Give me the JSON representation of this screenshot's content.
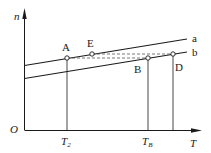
{
  "diagram": {
    "axes": {
      "y_label": "n",
      "x_label": "T",
      "origin_label": "O"
    },
    "lines": [
      {
        "id": "a",
        "label": "a"
      },
      {
        "id": "b",
        "label": "b"
      }
    ],
    "points": {
      "A": "A",
      "E": "E",
      "B": "B",
      "D": "D"
    },
    "x_ticks": {
      "T2_main": "T",
      "T2_sub": "2",
      "TB_main": "T",
      "TB_sub": "B"
    },
    "colors": {
      "line": "#1a1a1a",
      "dashed": "#555555",
      "background": "#ffffff"
    }
  }
}
